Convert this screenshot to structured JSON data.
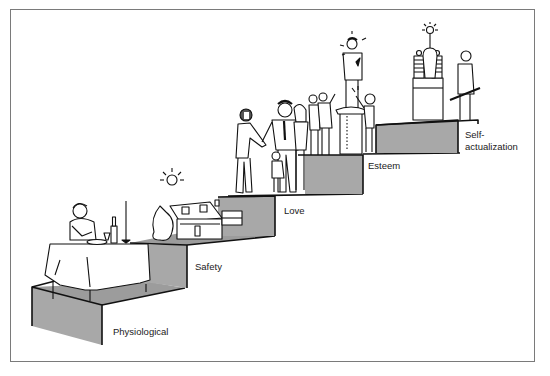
{
  "diagram": {
    "type": "staircase-hierarchy",
    "steps": [
      {
        "level": 1,
        "label": "Physiological",
        "scene": "person eating at dinner table with wine bottle and candle"
      },
      {
        "level": 2,
        "label": "Safety",
        "scene": "house with trees and sun"
      },
      {
        "level": 3,
        "label": "Love",
        "scene": "men shaking hands, family with child"
      },
      {
        "level": 4,
        "label": "Esteem",
        "scene": "person on pedestal applauded by crowd"
      },
      {
        "level": 5,
        "label": "Self-\nactualization",
        "label_line1": "Self-",
        "label_line2": "actualization",
        "scene": "inventor beside machine with glowing light bulb"
      }
    ]
  },
  "colors": {
    "step_face": "#a8a8a8",
    "step_top": "#9a9a9a",
    "line": "#111111",
    "frame": "#7a7a7a",
    "background": "#ffffff"
  }
}
